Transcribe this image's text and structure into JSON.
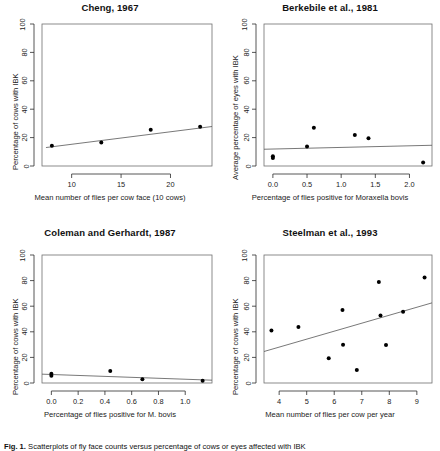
{
  "figure": {
    "caption_prefix": "Fig. 1.",
    "caption_text": "Scatterplots of fly face counts versus percentage of cows or eyes affected with IBK"
  },
  "chart_data": [
    {
      "type": "scatter",
      "title": "Cheng, 1967",
      "xlabel": "Mean number of flies per cow face (10 cows)",
      "ylabel": "Percentage of cows with IBK",
      "xlim": [
        7.0,
        24.2
      ],
      "ylim": [
        0,
        100
      ],
      "xticks": [
        10,
        15,
        20
      ],
      "yticks": [
        0,
        20,
        40,
        60,
        80,
        100
      ],
      "grid": false,
      "points": [
        {
          "x": 8.0,
          "y": 14.2
        },
        {
          "x": 13.0,
          "y": 16.6
        },
        {
          "x": 18.0,
          "y": 25.5
        },
        {
          "x": 23.0,
          "y": 27.6
        }
      ],
      "trendline": {
        "x1": 7.4,
        "y1": 13.0,
        "x2": 24.2,
        "y2": 27.8
      }
    },
    {
      "type": "scatter",
      "title": "Berkebile et al., 1981",
      "xlabel": "Percentage of flies positive for Moraxella bovis",
      "ylabel": "Average percentage of eyes with IBK",
      "xlim": [
        -0.13,
        2.33
      ],
      "ylim": [
        0,
        100
      ],
      "xticks": [
        0.0,
        0.5,
        1.0,
        1.5,
        2.0
      ],
      "yticks": [
        0,
        20,
        40,
        60,
        80,
        100
      ],
      "grid": false,
      "points": [
        {
          "x": 0.0,
          "y": 6.8
        },
        {
          "x": 0.0,
          "y": 5.6
        },
        {
          "x": 0.5,
          "y": 13.8
        },
        {
          "x": 0.6,
          "y": 27.0
        },
        {
          "x": 1.2,
          "y": 21.8
        },
        {
          "x": 1.4,
          "y": 19.5
        },
        {
          "x": 2.2,
          "y": 2.5
        }
      ],
      "trendline": {
        "x1": -0.13,
        "y1": 11.8,
        "x2": 2.33,
        "y2": 14.6
      }
    },
    {
      "type": "scatter",
      "title": "Coleman and Gerhardt, 1987",
      "xlabel": "Percentage of flies positive for M. bovis",
      "ylabel": "Percentage of cows with IBK",
      "xlim": [
        -0.07,
        1.2
      ],
      "ylim": [
        0,
        100
      ],
      "xticks": [
        0.0,
        0.2,
        0.4,
        0.6,
        0.8,
        1.0
      ],
      "yticks": [
        0,
        20,
        40,
        60,
        80,
        100
      ],
      "grid": false,
      "points": [
        {
          "x": 0.0,
          "y": 7.2
        },
        {
          "x": 0.0,
          "y": 5.6
        },
        {
          "x": 0.44,
          "y": 9.3
        },
        {
          "x": 0.68,
          "y": 3.0
        },
        {
          "x": 1.13,
          "y": 1.7
        }
      ],
      "trendline": {
        "x1": -0.07,
        "y1": 6.9,
        "x2": 1.2,
        "y2": 2.2
      }
    },
    {
      "type": "scatter",
      "title": "Steelman et al., 1993",
      "xlabel": "Mean number of flies per cow per year",
      "ylabel": "Percentage of cows with IBK",
      "xlim": [
        3.45,
        9.55
      ],
      "ylim": [
        0,
        100
      ],
      "xticks": [
        4,
        5,
        6,
        7,
        8,
        9
      ],
      "yticks": [
        0,
        20,
        40,
        60,
        80,
        100
      ],
      "grid": false,
      "points": [
        {
          "x": 3.72,
          "y": 41.0
        },
        {
          "x": 4.7,
          "y": 43.8
        },
        {
          "x": 5.8,
          "y": 19.3
        },
        {
          "x": 6.3,
          "y": 57.0
        },
        {
          "x": 6.32,
          "y": 29.8
        },
        {
          "x": 6.82,
          "y": 10.2
        },
        {
          "x": 7.62,
          "y": 79.0
        },
        {
          "x": 7.68,
          "y": 52.8
        },
        {
          "x": 7.88,
          "y": 29.6
        },
        {
          "x": 8.5,
          "y": 55.6
        },
        {
          "x": 9.28,
          "y": 82.5
        }
      ],
      "trendline": {
        "x1": 3.45,
        "y1": 24.6,
        "x2": 9.55,
        "y2": 62.6
      }
    }
  ]
}
